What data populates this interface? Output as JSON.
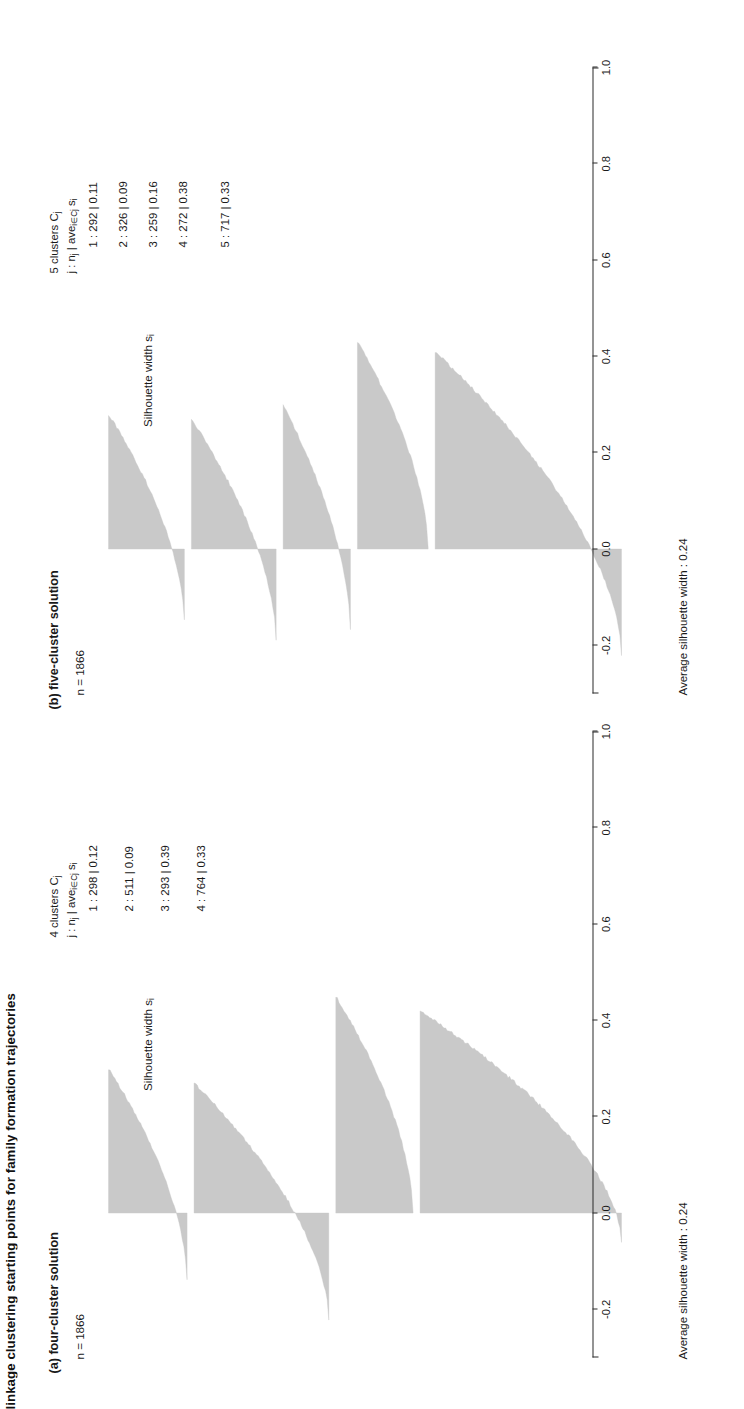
{
  "figure": {
    "title": "linkage clustering starting points for family formation trajectories",
    "axis_title": "Silhouette width s",
    "axis_title_sub": "i",
    "tick_labels": [
      "-0.2",
      "0.0",
      "0.2",
      "0.4",
      "0.6",
      "0.8",
      "1.0"
    ],
    "tick_values": [
      -0.2,
      0.0,
      0.2,
      0.4,
      0.6,
      0.8,
      1.0
    ],
    "bar_color": "#c9c9c9",
    "axis_color": "#2b2b2b"
  },
  "panels": [
    {
      "label": "(a)  four-cluster solution",
      "n_text": "n = 1866",
      "legend_head": "4 clusters C",
      "legend_head_sub": "j",
      "legend_sub_parts": [
        "j :  n",
        "j",
        " | ave",
        "i∈Cj",
        "   s",
        "i"
      ],
      "legend_rows": [
        "1 : 298 | 0.12",
        "2 : 511 | 0.09",
        "3 : 293 | 0.39",
        "4 : 764 | 0.33"
      ],
      "avg_note": "Average silhouette width : 0.24"
    },
    {
      "label": "(b)  five-cluster solution",
      "n_text": "n = 1866",
      "legend_head": "5 clusters C",
      "legend_head_sub": "j",
      "legend_sub_parts": [
        "j :  n",
        "j",
        " | ave",
        "i∈Cj",
        "   s",
        "i"
      ],
      "legend_rows": [
        "1 : 292 | 0.11",
        "2 : 326 | 0.09",
        "3 : 259 | 0.16",
        "4 : 272 | 0.38",
        "5 : 717 | 0.33"
      ],
      "avg_note": "Average silhouette width : 0.24"
    }
  ],
  "chart_data": {
    "type": "bar",
    "title": "linkage clustering starting points for family formation trajectories",
    "xlabel": "Silhouette width s_i",
    "ylabel": "",
    "xlim": [
      -0.3,
      1.0
    ],
    "grid": false,
    "legend_position": "top-right",
    "charts": [
      {
        "panel": "(a) four-cluster solution",
        "n": 1866,
        "average_silhouette_width": 0.24,
        "clusters": [
          {
            "j": 1,
            "n_j": 298,
            "ave_s_i": 0.12,
            "max_s": 0.3,
            "min_s": -0.14
          },
          {
            "j": 2,
            "n_j": 511,
            "ave_s_i": 0.09,
            "max_s": 0.27,
            "min_s": -0.22
          },
          {
            "j": 3,
            "n_j": 293,
            "ave_s_i": 0.39,
            "max_s": 0.45,
            "min_s": 0.0
          },
          {
            "j": 4,
            "n_j": 764,
            "ave_s_i": 0.33,
            "max_s": 0.42,
            "min_s": -0.06
          }
        ]
      },
      {
        "panel": "(b) five-cluster solution",
        "n": 1866,
        "average_silhouette_width": 0.24,
        "clusters": [
          {
            "j": 1,
            "n_j": 292,
            "ave_s_i": 0.11,
            "max_s": 0.28,
            "min_s": -0.15
          },
          {
            "j": 2,
            "n_j": 326,
            "ave_s_i": 0.09,
            "max_s": 0.27,
            "min_s": -0.19
          },
          {
            "j": 3,
            "n_j": 259,
            "ave_s_i": 0.16,
            "max_s": 0.3,
            "min_s": -0.17
          },
          {
            "j": 4,
            "n_j": 272,
            "ave_s_i": 0.38,
            "max_s": 0.43,
            "min_s": 0.0
          },
          {
            "j": 5,
            "n_j": 717,
            "ave_s_i": 0.33,
            "max_s": 0.41,
            "min_s": -0.22
          }
        ]
      }
    ]
  }
}
